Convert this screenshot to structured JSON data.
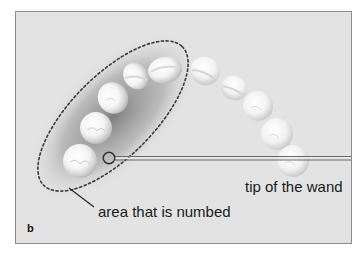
{
  "figure": {
    "panel_letter": "b",
    "background_color": "#e3e3e3",
    "frame_color": "#8c8c8c"
  },
  "annotations": {
    "wand_label": "tip of the wand",
    "numbed_label": "area that is numbed"
  },
  "teeth": [
    {
      "cx": 80,
      "cy": 161,
      "r": 17
    },
    {
      "cx": 96,
      "cy": 128,
      "r": 16
    },
    {
      "cx": 113,
      "cy": 98,
      "r": 15
    },
    {
      "cx": 136,
      "cy": 75,
      "r": 13
    },
    {
      "cx": 165,
      "cy": 70,
      "r": 15
    },
    {
      "cx": 205,
      "cy": 71,
      "r": 15
    },
    {
      "cx": 234,
      "cy": 88,
      "r": 13
    },
    {
      "cx": 258,
      "cy": 106,
      "r": 15
    },
    {
      "cx": 277,
      "cy": 134,
      "r": 16
    },
    {
      "cx": 292,
      "cy": 161,
      "r": 16
    }
  ]
}
